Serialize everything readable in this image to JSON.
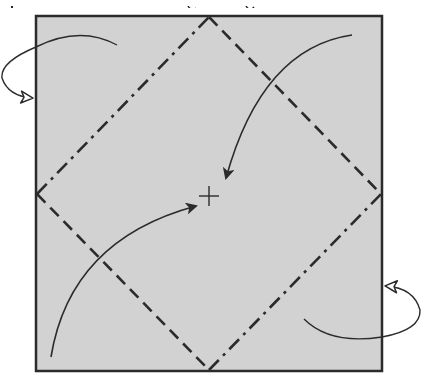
{
  "diagram": {
    "type": "origami-folding-step",
    "canvas": {
      "width": 434,
      "height": 383,
      "background": "#ffffff"
    },
    "paper": {
      "x": 36,
      "y": 16,
      "width": 346,
      "height": 355,
      "fill": "#d2d2d2",
      "stroke": "#2b2b2b",
      "stroke_width": 2.5
    },
    "creases": [
      {
        "name": "top-left",
        "kind": "mountain-fold",
        "pattern": "dash-dot",
        "from": [
          37,
          194
        ],
        "to": [
          209,
          17
        ]
      },
      {
        "name": "top-right",
        "kind": "valley-fold",
        "pattern": "dash",
        "from": [
          209,
          17
        ],
        "to": [
          381,
          194
        ]
      },
      {
        "name": "bottom-left",
        "kind": "valley-fold",
        "pattern": "dash",
        "from": [
          37,
          194
        ],
        "to": [
          209,
          370
        ]
      },
      {
        "name": "bottom-right",
        "kind": "mountain-fold",
        "pattern": "dash-dot",
        "from": [
          209,
          370
        ],
        "to": [
          381,
          194
        ]
      }
    ],
    "center_mark": {
      "x": 209,
      "y": 196,
      "size": 20,
      "symbol": "+"
    },
    "arrows": [
      {
        "name": "fold-top-right-corner-to-center",
        "kind": "valley",
        "head": "filled",
        "path": "M 352 35 Q 262 48 226 178"
      },
      {
        "name": "fold-bottom-left-corner-to-center",
        "kind": "valley",
        "head": "filled",
        "path": "M 51 357 Q 70 240 196 206"
      },
      {
        "name": "fold-top-left-corner-behind",
        "kind": "mountain",
        "head": "hollow",
        "path": "M 117 45 Q 80 25 36 47 Q 0 62 2 78 Q 8 96 32 98"
      },
      {
        "name": "fold-bottom-right-corner-behind",
        "kind": "mountain",
        "head": "hollow",
        "path": "M 304 319 Q 330 345 382 337 Q 421 330 420 310 Q 414 288 386 286"
      }
    ],
    "colors": {
      "ink": "#2b2b2b",
      "paper": "#d2d2d2",
      "background": "#ffffff"
    }
  }
}
